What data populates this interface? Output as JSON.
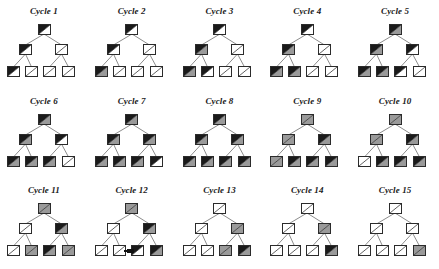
{
  "figure": {
    "rows": 3,
    "columns": 5,
    "node_count_per_tree": 7
  },
  "legend": {
    "states": [
      "black",
      "gray",
      "white"
    ],
    "colors": {
      "black": "#1a1a1a",
      "gray": "#9a9a9a",
      "white": "#ffffff",
      "outline": "#2b2b2b",
      "edge": "#6f6f6f",
      "text": "#1a1a1a",
      "background": "#ffffff"
    }
  },
  "chart_data": {
    "type": "diagram",
    "node_shape": "square-with-diagonal",
    "tree_structure": {
      "root": "root",
      "internal": [
        "left",
        "right"
      ],
      "leaves": [
        "leaf1",
        "leaf2",
        "leaf3",
        "leaf4"
      ],
      "edges": [
        [
          "root",
          "left"
        ],
        [
          "root",
          "right"
        ],
        [
          "left",
          "leaf1"
        ],
        [
          "left",
          "leaf2"
        ],
        [
          "right",
          "leaf3"
        ],
        [
          "right",
          "leaf4"
        ]
      ]
    },
    "cycles": [
      {
        "label": "Cycle 1",
        "root": "black",
        "left": "black",
        "right": "white",
        "leaves": [
          "black",
          "white",
          "white",
          "white"
        ],
        "marker": false
      },
      {
        "label": "Cycle 2",
        "root": "black",
        "left": "black",
        "right": "white",
        "leaves": [
          "black",
          "white",
          "white",
          "white"
        ],
        "leaf_fill_note": "leaf1 lower triangle shaded gray",
        "leaves_lower": [
          "gray",
          "white",
          "white",
          "white"
        ],
        "marker": false
      },
      {
        "label": "Cycle 3",
        "root": "black",
        "left": "black",
        "right": "white",
        "leaves": [
          "black",
          "black",
          "white",
          "white"
        ],
        "leaves_lower": [
          "gray",
          "white",
          "white",
          "white"
        ],
        "left_lower": "gray",
        "marker": false
      },
      {
        "label": "Cycle 4",
        "root": "black",
        "left": "black",
        "right": "white",
        "leaves": [
          "black",
          "black",
          "white",
          "white"
        ],
        "leaves_lower": [
          "gray",
          "gray",
          "white",
          "white"
        ],
        "left_lower": "gray",
        "marker": false
      },
      {
        "label": "Cycle 5",
        "root": "black",
        "left": "black",
        "right": "black",
        "leaves": [
          "black",
          "black",
          "black",
          "white"
        ],
        "leaves_lower": [
          "gray",
          "gray",
          "white",
          "white"
        ],
        "root_lower": "gray",
        "left_lower": "gray",
        "right_lower": "white",
        "marker": false
      },
      {
        "label": "Cycle 6",
        "root": "black",
        "left": "black",
        "right": "black",
        "leaves": [
          "black",
          "black",
          "black",
          "white"
        ],
        "leaves_lower": [
          "gray",
          "gray",
          "gray",
          "white"
        ],
        "root_lower": "gray",
        "left_lower": "gray",
        "right_lower": "white",
        "marker": false
      },
      {
        "label": "Cycle 7",
        "root": "black",
        "left": "black",
        "right": "black",
        "leaves": [
          "black",
          "black",
          "black",
          "black"
        ],
        "leaves_lower": [
          "gray",
          "gray",
          "gray",
          "white"
        ],
        "root_lower": "gray",
        "left_lower": "gray",
        "right_lower": "gray",
        "marker": false
      },
      {
        "label": "Cycle 8",
        "root": "black",
        "left": "black",
        "right": "black",
        "leaves": [
          "black",
          "black",
          "black",
          "black"
        ],
        "leaves_lower": [
          "gray",
          "gray",
          "gray",
          "gray"
        ],
        "root_lower": "gray",
        "left_lower": "gray",
        "right_lower": "gray",
        "marker": false
      },
      {
        "label": "Cycle 9",
        "root": "gray",
        "left": "gray",
        "right": "black",
        "leaves": [
          "gray",
          "black",
          "black",
          "black"
        ],
        "leaves_lower": [
          "gray",
          "gray",
          "gray",
          "gray"
        ],
        "root_lower": "gray",
        "left_lower": "gray",
        "right_lower": "gray",
        "marker": false
      },
      {
        "label": "Cycle 10",
        "root": "gray",
        "left": "gray",
        "right": "black",
        "leaves": [
          "white",
          "black",
          "black",
          "black"
        ],
        "leaves_lower": [
          "white",
          "gray",
          "gray",
          "gray"
        ],
        "root_lower": "gray",
        "left_lower": "gray",
        "right_lower": "gray",
        "marker": false
      },
      {
        "label": "Cycle 11",
        "root": "gray",
        "left": "white",
        "right": "black",
        "leaves": [
          "white",
          "gray",
          "black",
          "gray"
        ],
        "leaves_lower": [
          "white",
          "gray",
          "gray",
          "gray"
        ],
        "root_lower": "gray",
        "left_lower": "white",
        "right_lower": "gray",
        "marker": false
      },
      {
        "label": "Cycle 12",
        "root": "gray",
        "left": "white",
        "right": "black",
        "leaves": [
          "white",
          "white",
          "black",
          "black"
        ],
        "leaves_lower": [
          "white",
          "white",
          "white",
          "gray"
        ],
        "root_lower": "gray",
        "left_lower": "white",
        "right_lower": "gray",
        "marker": true
      },
      {
        "label": "Cycle 13",
        "root": "white",
        "left": "white",
        "right": "gray",
        "leaves": [
          "white",
          "white",
          "gray",
          "black"
        ],
        "leaves_lower": [
          "white",
          "white",
          "gray",
          "gray"
        ],
        "root_lower": "white",
        "left_lower": "white",
        "right_lower": "gray",
        "marker": false
      },
      {
        "label": "Cycle 14",
        "root": "white",
        "left": "white",
        "right": "gray",
        "leaves": [
          "white",
          "white",
          "white",
          "black"
        ],
        "leaves_lower": [
          "white",
          "white",
          "white",
          "gray"
        ],
        "root_lower": "white",
        "left_lower": "white",
        "right_lower": "gray",
        "marker": false
      },
      {
        "label": "Cycle 15",
        "root": "white",
        "left": "white",
        "right": "white",
        "leaves": [
          "white",
          "white",
          "white",
          "gray"
        ],
        "leaves_lower": [
          "white",
          "white",
          "white",
          "gray"
        ],
        "root_lower": "white",
        "left_lower": "white",
        "right_lower": "white",
        "marker": false
      }
    ]
  }
}
